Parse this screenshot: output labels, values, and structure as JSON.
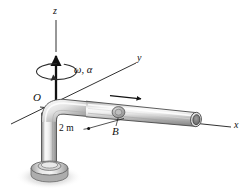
{
  "figure": {
    "background_color": "#ffffff",
    "width": 247,
    "height": 196
  },
  "labels": {
    "axis_z": "z",
    "axis_y": "y",
    "axis_x": "x",
    "origin": "O",
    "collar": "B",
    "angular": "ω, α",
    "dimension": "2 m"
  },
  "colors": {
    "line": "#1a1a1a",
    "pipe_light": "#f2f2f2",
    "pipe_mid": "#c9c9c9",
    "pipe_dark": "#8e8e8e",
    "pipe_edge": "#4a4a4a",
    "bore_dark": "#6b6b6b",
    "shadow": "#d8d8d8",
    "collar": "#b5b5b5"
  },
  "elements": {
    "z_axis": "vertical-axis-with-arrow",
    "spin_arrow": "rotation-ellipse-arrow",
    "slide_arrow": "collar-velocity-arrow",
    "dimension_leader": "leader-line-to-pipe",
    "pipe": "bent-pipe-elbow",
    "base": "pipe-base-flange",
    "collar_ball": "collar-at-B"
  }
}
